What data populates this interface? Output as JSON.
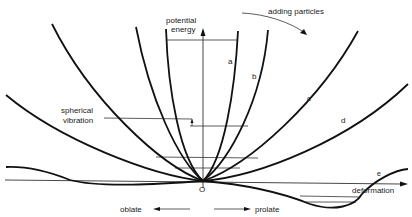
{
  "diagram": {
    "axes": {
      "y_label_line1": "potential",
      "y_label_line2": "energy",
      "x_label": "deformation",
      "origin_label": "O"
    },
    "annotations": {
      "adding_particles": "adding particles",
      "spherical_vibration_line1": "spherical",
      "spherical_vibration_line2": "vibration",
      "oblate": "oblate",
      "prolate": "prolate"
    },
    "curves": [
      {
        "id": "a",
        "label": "a",
        "shape": "narrow parabola"
      },
      {
        "id": "b",
        "label": "b",
        "shape": "parabola"
      },
      {
        "id": "c",
        "label": "c",
        "shape": "wide parabola"
      },
      {
        "id": "d",
        "label": "d",
        "shape": "wider parabola"
      },
      {
        "id": "e",
        "label": "e",
        "shape": "deformed minimum on prolate side"
      }
    ],
    "colors": {
      "line": "#111111",
      "background": "#ffffff"
    }
  }
}
